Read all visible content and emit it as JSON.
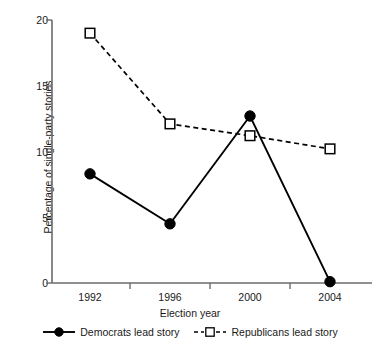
{
  "chart_data": {
    "type": "line",
    "title": "",
    "xlabel": "Election year",
    "ylabel": "Percentage of single-party stories",
    "categories": [
      "1992",
      "1996",
      "2000",
      "2004"
    ],
    "x": [
      1992,
      1996,
      2000,
      2004
    ],
    "xlim": [
      1990,
      2006
    ],
    "ylim": [
      0,
      20
    ],
    "ytick_labels": [
      "0",
      "5",
      "10",
      "15",
      "20"
    ],
    "yticks": [
      0,
      5,
      10,
      15,
      20
    ],
    "grid": false,
    "legend_position": "bottom",
    "series": [
      {
        "name": "Democrats lead story",
        "values": [
          8.3,
          4.5,
          12.7,
          0.1
        ],
        "marker": "filled-circle",
        "linestyle": "solid",
        "color": "#000000"
      },
      {
        "name": "Republicans lead story",
        "values": [
          19.0,
          12.1,
          11.2,
          10.2
        ],
        "marker": "open-square",
        "linestyle": "dashed",
        "color": "#000000"
      }
    ]
  },
  "axes": {
    "y_title": "Percentage of single-party stories",
    "x_title": "Election year",
    "ytick_0": "0",
    "ytick_5": "5",
    "ytick_10": "10",
    "ytick_15": "15",
    "ytick_20": "20",
    "xtick_0": "1992",
    "xtick_1": "1996",
    "xtick_2": "2000",
    "xtick_3": "2004"
  },
  "legend": {
    "items": [
      {
        "label": "Democrats lead story",
        "marker": "filled-circle-icon"
      },
      {
        "label": "Republicans lead story",
        "marker": "open-square-icon"
      }
    ]
  },
  "colors": {
    "line": "#000000",
    "axis": "#6b6b6b",
    "text": "#1a1a1a",
    "background": "#ffffff"
  }
}
